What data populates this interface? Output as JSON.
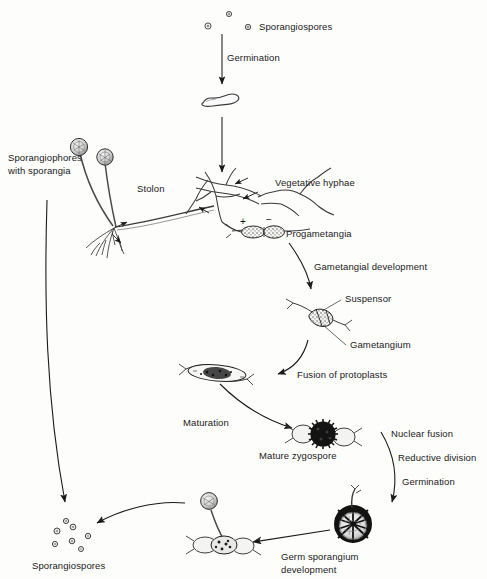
{
  "diagram": {
    "background_color": "#fdfdfc",
    "ink_color": "#1a1a1a",
    "width": 487,
    "height": 579,
    "labels": {
      "sporangiospores_top": "Sporangiospores",
      "germination_top": "Germination",
      "sporangiophores_with_sporangia": "Sporangiophores\nwith sporangia",
      "sporangiophores_line1": "Sporangiophores",
      "sporangiophores_line2": "with sporangia",
      "stolon": "Stolon",
      "vegetative_hyphae": "Vegetative hyphae",
      "progametangia": "Progametangia",
      "gametangial_development": "Gametangial development",
      "suspensor": "Suspensor",
      "gametangium": "Gametangium",
      "fusion_of_protoplasts": "Fusion of protoplasts",
      "maturation": "Maturation",
      "mature_zygospore": "Mature zygospore",
      "nuclear_fusion": "Nuclear fusion",
      "reductive_division": "Reductive division",
      "germination_right": "Germination",
      "germ_sporangium_development": "Germ sporangium\ndevelopment",
      "germ_sporangium_line1": "Germ sporangium",
      "germ_sporangium_line2": "development",
      "sporangiospores_bottom": "Sporangiospores",
      "mating_type_plus": "+",
      "mating_type_minus": "−"
    },
    "stages": [
      {
        "name": "sporangiospores-top",
        "label": "Sporangiospores",
        "spore_count": 3
      },
      {
        "name": "germinating-spore",
        "label": ""
      },
      {
        "name": "mycelium-stolon-rhizoids",
        "label": "Stolon"
      },
      {
        "name": "sporangiophores",
        "label": "Sporangiophores with sporangia",
        "sporangia_count": 2
      },
      {
        "name": "progametangia",
        "label": "Progametangia"
      },
      {
        "name": "gametangia",
        "label": "Gametangium"
      },
      {
        "name": "zygote-fusion",
        "label": "Fusion of protoplasts"
      },
      {
        "name": "mature-zygospore",
        "label": "Mature zygospore"
      },
      {
        "name": "germinating-zygospore",
        "label": "Germination"
      },
      {
        "name": "germ-sporangium",
        "label": "Germ sporangium development"
      },
      {
        "name": "sporangiospores-bottom",
        "label": "Sporangiospores",
        "spore_count": 7
      }
    ]
  }
}
